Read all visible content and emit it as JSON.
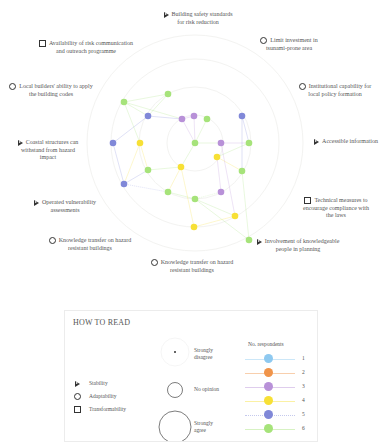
{
  "chart_data": {
    "type": "radar-dot",
    "title": "",
    "center": [
      195,
      143
    ],
    "axes": [
      {
        "label": "Building safety standards for risk reduction",
        "category": "Stability"
      },
      {
        "label": "Limit investment in tsunami-prone area",
        "category": "Adaptability"
      },
      {
        "label": "Institutional capability for local policy formation",
        "category": "Adaptability"
      },
      {
        "label": "Accessible information",
        "category": "Stability"
      },
      {
        "label": "Technical measures to encourage compliance with the laws",
        "category": "Transformability"
      },
      {
        "label": "Involvement of knowledgeable people in planning",
        "category": "Stability"
      },
      {
        "label": "Knowledge transfer on hazard resistant buildings",
        "category": "Adaptability"
      },
      {
        "label": "Knowledge transfer on hazard resistant buildings",
        "category": "Adaptability"
      },
      {
        "label": "Operated vulnerability assessments",
        "category": "Stability"
      },
      {
        "label": "Coastal structures can withstand from hazard impact",
        "category": "Stability"
      },
      {
        "label": "Local builders' ability to apply the building codes",
        "category": "Adaptability"
      },
      {
        "label": "Availability of risk communication and outreach programme",
        "category": "Transformability"
      }
    ],
    "series": [
      {
        "name": "1",
        "color": "#8ec9f0"
      },
      {
        "name": "2",
        "color": "#f0944a"
      },
      {
        "name": "3",
        "color": "#b891d8"
      },
      {
        "name": "4",
        "color": "#f7e035"
      },
      {
        "name": "5",
        "color": "#8088d8"
      },
      {
        "name": "6",
        "color": "#a6e37a"
      }
    ],
    "points": [
      {
        "x": 124,
        "y": 102,
        "series": "6"
      },
      {
        "x": 168,
        "y": 94,
        "series": "6"
      },
      {
        "x": 148,
        "y": 116,
        "series": "5"
      },
      {
        "x": 182,
        "y": 119,
        "series": "3"
      },
      {
        "x": 194,
        "y": 116,
        "series": "3"
      },
      {
        "x": 207,
        "y": 119,
        "series": "6"
      },
      {
        "x": 242,
        "y": 116,
        "series": "5"
      },
      {
        "x": 113,
        "y": 143,
        "series": "5"
      },
      {
        "x": 140,
        "y": 143,
        "series": "4"
      },
      {
        "x": 195,
        "y": 143,
        "series": "6"
      },
      {
        "x": 221,
        "y": 143,
        "series": "3"
      },
      {
        "x": 249,
        "y": 143,
        "series": "6"
      },
      {
        "x": 217,
        "y": 157,
        "series": "4"
      },
      {
        "x": 148,
        "y": 170,
        "series": "6"
      },
      {
        "x": 181,
        "y": 167,
        "series": "4"
      },
      {
        "x": 242,
        "y": 171,
        "series": "6"
      },
      {
        "x": 124,
        "y": 184,
        "series": "5"
      },
      {
        "x": 168,
        "y": 192,
        "series": "6"
      },
      {
        "x": 195,
        "y": 199,
        "series": "6"
      },
      {
        "x": 221,
        "y": 192,
        "series": "3"
      },
      {
        "x": 235,
        "y": 216,
        "series": "4"
      },
      {
        "x": 194,
        "y": 227,
        "series": "4"
      },
      {
        "x": 249,
        "y": 240,
        "series": "6"
      }
    ],
    "legend_position": "bottom"
  },
  "labels": [
    {
      "text1": "Building safety standards",
      "text2": "for risk reduction",
      "icon": "triangle",
      "x": 158,
      "y": 11,
      "w": 80
    },
    {
      "text1": "Limit investment in",
      "text2": "tsunami-prone area",
      "icon": "circle",
      "x": 254,
      "y": 37,
      "w": 70
    },
    {
      "text1": "Institutional capability for",
      "text2": "local policy formation",
      "icon": "circle",
      "x": 294,
      "y": 83,
      "w": 82
    },
    {
      "text1": "Accessible information",
      "text2": "",
      "icon": "triangle",
      "x": 308,
      "y": 138,
      "w": 76
    },
    {
      "text1": "Technical measures to",
      "text2": "encourage compliance with",
      "text3": "the laws",
      "icon": "square",
      "x": 292,
      "y": 197,
      "w": 88
    },
    {
      "text1": "Involvement of knowledgeable",
      "text2": "people in planning",
      "icon": "triangle",
      "x": 252,
      "y": 238,
      "w": 92
    },
    {
      "text1": "Knowledge transfer on hazard",
      "text2": "resistant buildings",
      "icon": "circle",
      "x": 144,
      "y": 259,
      "w": 96
    },
    {
      "text1": "Knowledge transfer on hazard",
      "text2": "resistant buildings",
      "icon": "circle",
      "x": 45,
      "y": 237,
      "w": 90
    },
    {
      "text1": "Operated vulnerability",
      "text2": "assessments",
      "icon": "triangle",
      "x": 30,
      "y": 199,
      "w": 70
    },
    {
      "text1": "Coastal structures can",
      "text2": "withstand from hazard",
      "text3": "impact",
      "icon": "triangle",
      "x": 8,
      "y": 139,
      "w": 80
    },
    {
      "text1": "Local builders' ability to apply",
      "text2": "the building codes",
      "icon": "circle",
      "x": 8,
      "y": 83,
      "w": 86
    },
    {
      "text1": "Availability of risk communication",
      "text2": "and outreach programme",
      "icon": "square",
      "x": 36,
      "y": 40,
      "w": 100
    }
  ],
  "legend": {
    "title": "HOW TO READ",
    "shapes": [
      {
        "icon": "triangle",
        "label": "Stability"
      },
      {
        "icon": "circle",
        "label": "Adaptability"
      },
      {
        "icon": "square",
        "label": "Transformability"
      }
    ],
    "sizes": [
      {
        "label1": "Strongly",
        "label2": "disagree"
      },
      {
        "label1": "No opinion",
        "label2": ""
      },
      {
        "label1": "Strongly",
        "label2": "agree"
      }
    ],
    "respondents_title": "No. respondents",
    "respondents": [
      {
        "n": "1",
        "color": "#8ec9f0"
      },
      {
        "n": "2",
        "color": "#f0944a"
      },
      {
        "n": "3",
        "color": "#b891d8"
      },
      {
        "n": "4",
        "color": "#f7e035"
      },
      {
        "n": "5",
        "color": "#8088d8"
      },
      {
        "n": "6",
        "color": "#a6e37a"
      }
    ]
  }
}
